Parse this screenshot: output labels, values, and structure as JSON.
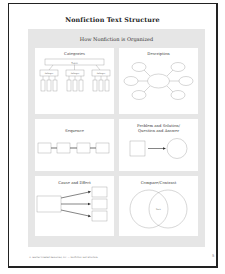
{
  "page": {
    "title": "Nonfiction Text Structure",
    "subtitle": "How Nonfiction is Organized",
    "footer": "© Teacher Created Resources, Inc. — Nonfiction Text Structure",
    "page_number": "5"
  },
  "cards": [
    {
      "label": "Categories",
      "topic": "Topic",
      "subtopics": [
        "Subtopic",
        "Subtopic",
        "Subtopic"
      ]
    },
    {
      "label": "Description"
    },
    {
      "label": "Sequence"
    },
    {
      "label": "Problem and Solution/\nQuestion and Answer",
      "label_line1": "Problem and Solution/",
      "label_line2": "Question and Answer"
    },
    {
      "label": "Cause and Effect"
    },
    {
      "label": "Compare/Contrast",
      "center_label": "Both"
    }
  ]
}
